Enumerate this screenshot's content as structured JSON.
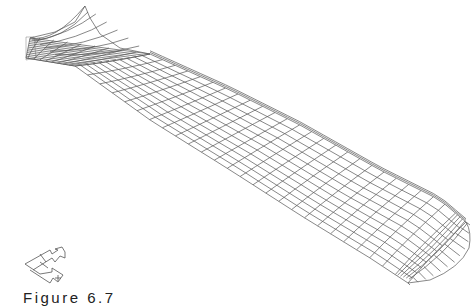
{
  "figure": {
    "caption": "Figure 6.7",
    "line_color": "#555555",
    "background": "#ffffff"
  },
  "mesh": {
    "spanwise_stations": 26,
    "chordwise_lines": 11,
    "root_fillet_stations": 8,
    "tip_rounding_stations": 5,
    "outline": {
      "leading_edge": [
        [
          30,
          38
        ],
        [
          60,
          46
        ],
        [
          100,
          52
        ],
        [
          150,
          54
        ],
        [
          230,
          90
        ],
        [
          300,
          125
        ],
        [
          380,
          170
        ],
        [
          440,
          200
        ],
        [
          470,
          225
        ]
      ],
      "trailing_edge": [
        [
          26,
          58
        ],
        [
          50,
          62
        ],
        [
          75,
          66
        ],
        [
          150,
          120
        ],
        [
          230,
          170
        ],
        [
          300,
          215
        ],
        [
          370,
          258
        ],
        [
          410,
          285
        ]
      ],
      "tip": [
        [
          470,
          225
        ],
        [
          468,
          245
        ],
        [
          455,
          262
        ],
        [
          430,
          278
        ],
        [
          410,
          285
        ]
      ],
      "root_cusp": [
        [
          30,
          38
        ],
        [
          55,
          32
        ],
        [
          75,
          22
        ],
        [
          85,
          6
        ],
        [
          90,
          18
        ],
        [
          100,
          34
        ],
        [
          120,
          48
        ],
        [
          150,
          54
        ]
      ]
    }
  },
  "axis_triad": {
    "labels": [
      "X",
      "Y",
      "Z"
    ],
    "origin": [
      25,
      264
    ]
  }
}
